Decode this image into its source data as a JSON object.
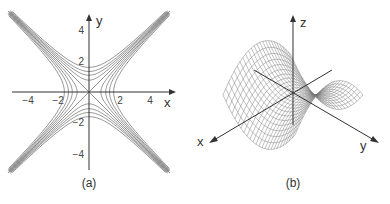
{
  "panels": [
    {
      "id": "a",
      "caption": "(a)",
      "title": "Level curves of saddle surface (hyperbolas)",
      "x_axis_label": "x",
      "y_axis_label": "y",
      "x_ticks": [
        "−4",
        "−2",
        "2",
        "4"
      ],
      "y_ticks": [
        "4",
        "2",
        "−2",
        "−4"
      ]
    },
    {
      "id": "b",
      "caption": "(b)",
      "title": "Saddle surface wireframe",
      "x_axis_label": "x",
      "y_axis_label": "y",
      "z_axis_label": "z"
    }
  ],
  "colors": {
    "line": "#555555",
    "axis": "#333333",
    "background": "#ffffff"
  }
}
